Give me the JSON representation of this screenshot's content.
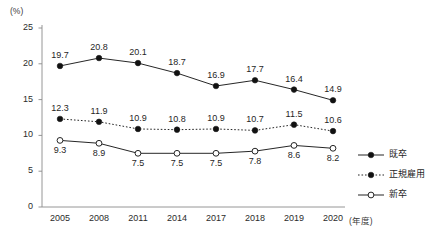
{
  "chart_data": {
    "type": "line",
    "title": "",
    "xlabel": "(年度)",
    "ylabel": "(%)",
    "categories": [
      "2005",
      "2008",
      "2011",
      "2014",
      "2017",
      "2018",
      "2019",
      "2020"
    ],
    "ylim": [
      0,
      25
    ],
    "yticks": [
      "0",
      "5",
      "10",
      "15",
      "20",
      "25"
    ],
    "grid": false,
    "legend_position": "right",
    "series": [
      {
        "name": "既卒",
        "marker": "filled-circle",
        "line_style": "solid",
        "label_position": "above",
        "values": [
          19.7,
          20.8,
          20.1,
          18.7,
          16.9,
          17.7,
          16.4,
          14.9
        ],
        "labels": [
          "19.7",
          "20.8",
          "20.1",
          "18.7",
          "16.9",
          "17.7",
          "16.4",
          "14.9"
        ]
      },
      {
        "name": "正規雇用",
        "marker": "filled-circle",
        "line_style": "dotted",
        "label_position": "above",
        "values": [
          12.3,
          11.9,
          10.9,
          10.8,
          10.9,
          10.7,
          11.5,
          10.6
        ],
        "labels": [
          "12.3",
          "11.9",
          "10.9",
          "10.8",
          "10.9",
          "10.7",
          "11.5",
          "10.6"
        ]
      },
      {
        "name": "新卒",
        "marker": "open-circle",
        "line_style": "solid",
        "label_position": "below",
        "values": [
          9.3,
          8.9,
          7.5,
          7.5,
          7.5,
          7.8,
          8.6,
          8.2
        ],
        "labels": [
          "9.3",
          "8.9",
          "7.5",
          "7.5",
          "7.5",
          "7.8",
          "8.6",
          "8.2"
        ]
      }
    ],
    "colors": {
      "line": "#1a1a1a",
      "marker_fill": "#111111",
      "marker_open_fill": "#ffffff",
      "axis": "#8a8a8a",
      "text": "#1f1f1f",
      "background": "#ffffff"
    }
  }
}
